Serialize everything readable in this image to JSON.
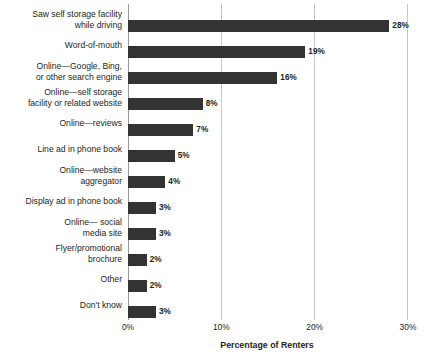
{
  "chart_data": {
    "type": "bar",
    "orientation": "horizontal",
    "title": "",
    "xlabel": "Percentage of Renters",
    "ylabel": "",
    "xlim": [
      0,
      30
    ],
    "xticks": [
      0,
      10,
      20,
      30
    ],
    "xtick_labels": [
      "0%",
      "10%",
      "20%",
      "30%"
    ],
    "grid": true,
    "legend": null,
    "value_label_suffix": "%",
    "bar_color": "#333333",
    "gridline_color": "#c9c9c9",
    "categories": [
      "Saw self storage facility\nwhile driving",
      "Word-of-mouth",
      "Online—Google, Bing,\nor other search engine",
      "Online—self storage\nfacility or related website",
      "Online—reviews",
      "Line ad in phone book",
      "Online—website\naggregator",
      "Display ad in phone book",
      "Online— social\nmedia site",
      "Flyer/promotional\nbrochure",
      "Other",
      "Don't know"
    ],
    "values": [
      28,
      19,
      16,
      8,
      7,
      5,
      4,
      3,
      3,
      2,
      2,
      3
    ],
    "value_labels": [
      "28%",
      "19%",
      "16%",
      "8%",
      "7%",
      "5%",
      "4%",
      "3%",
      "3%",
      "2%",
      "2%",
      "3%"
    ]
  }
}
